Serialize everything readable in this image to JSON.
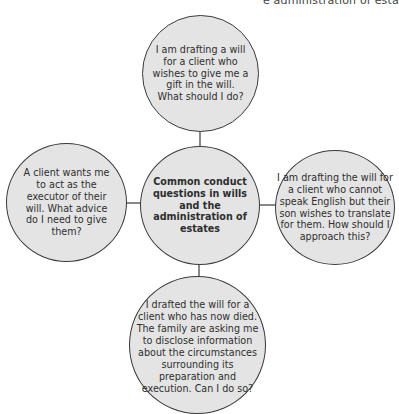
{
  "header": {
    "clipped_title": "e administration of esta"
  },
  "diagram": {
    "center": "Common conduct questions in wills and the administration of estates",
    "top": "I am drafting a will for a client who wishes to give me a gift in the will. What should I do?",
    "left": "A client wants me to act as the executor of their will. What advice do I need to give them?",
    "right": "I am drafting the will for a client who cannot speak English but their son wishes to translate for them. How should I approach this?",
    "bottom": "I drafted the will for a client who has now died. The family are asking me to disclose information about the circumstances surrounding its preparation and execution. Can I do so?"
  },
  "colors": {
    "node_fill": "#e4e4e4",
    "node_border": "#3a3a3a",
    "connector": "#3a3a3a"
  }
}
